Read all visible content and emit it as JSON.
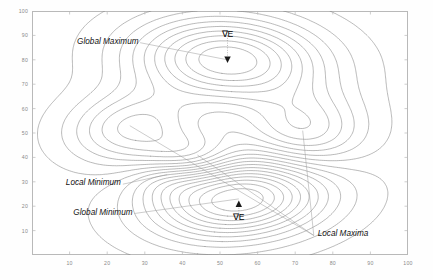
{
  "chart_data": {
    "type": "contour",
    "title": "",
    "xlabel": "",
    "ylabel": "",
    "xlim": [
      0,
      100
    ],
    "ylim": [
      0,
      100
    ],
    "grid": false,
    "legend_position": "none",
    "x_ticks": [
      10,
      20,
      30,
      40,
      50,
      60,
      70,
      80,
      90,
      100
    ],
    "y_ticks": [
      10,
      20,
      30,
      40,
      50,
      60,
      70,
      80,
      90,
      100
    ],
    "contour_line_color": "#808080",
    "frame_color": "#b9b9b9",
    "tick_label_color": "#8a8a8a",
    "n_levels": 22,
    "peaks": [
      {
        "name": "global-maximum",
        "x": 52,
        "y": 80,
        "amplitude": 100,
        "sx": 17,
        "sy": 12,
        "rot": -8
      },
      {
        "name": "local-maximum-left",
        "x": 27,
        "y": 52,
        "amplitude": 55,
        "sx": 12,
        "sy": 10,
        "rot": 20
      },
      {
        "name": "local-maximum-right",
        "x": 72,
        "y": 51,
        "amplitude": 52,
        "sx": 11,
        "sy": 11,
        "rot": 0
      },
      {
        "name": "local-maximum-middle",
        "x": 42,
        "y": 40,
        "amplitude": 42,
        "sx": 9,
        "sy": 7,
        "rot": 15
      },
      {
        "name": "global-minimum",
        "x": 55,
        "y": 23,
        "amplitude": -110,
        "sx": 16,
        "sy": 11,
        "rot": 12
      },
      {
        "name": "local-minimum",
        "x": 36,
        "y": 31,
        "amplitude": -22,
        "sx": 7,
        "sy": 6,
        "rot": 0
      }
    ],
    "annotations": [
      {
        "id": "global-maximum",
        "label": "Global Maximum",
        "text_x": 12,
        "text_y": 87,
        "target_x": 52,
        "target_y": 80
      },
      {
        "id": "local-minimum",
        "label": "Local Minimum",
        "text_x": 9,
        "text_y": 29,
        "target_x": 36,
        "target_y": 33
      },
      {
        "id": "global-minimum",
        "label": "Global Minimum",
        "text_x": 11,
        "text_y": 17,
        "target_x": 55,
        "target_y": 23
      },
      {
        "id": "local-maxima",
        "label": "Local Maxima",
        "text_x": 76,
        "target_y": 51,
        "text_y": 8,
        "target_x": 72
      }
    ],
    "gradient_markers": [
      {
        "id": "gradient-upper",
        "label": "∇E",
        "x": 52,
        "y": 90,
        "marker": "triangle-down",
        "marker_x": 52,
        "marker_y": 80
      },
      {
        "id": "gradient-lower",
        "label": "∇E",
        "x": 55,
        "y": 15,
        "marker": "triangle-up",
        "marker_x": 55,
        "marker_y": 21
      }
    ]
  },
  "axes": {
    "y_labels": [
      "100",
      "90",
      "80",
      "70",
      "60",
      "50",
      "40",
      "30",
      "20",
      "10"
    ],
    "x_labels": [
      "10",
      "20",
      "30",
      "40",
      "50",
      "60",
      "70",
      "80",
      "90",
      "100"
    ]
  },
  "annotations": {
    "global_maximum": "Global Maximum",
    "local_minimum": "Local Minimum",
    "global_minimum": "Global Minimum",
    "local_maxima": "Local Maxima",
    "gradient_upper": "∇E",
    "gradient_lower": "∇E"
  }
}
